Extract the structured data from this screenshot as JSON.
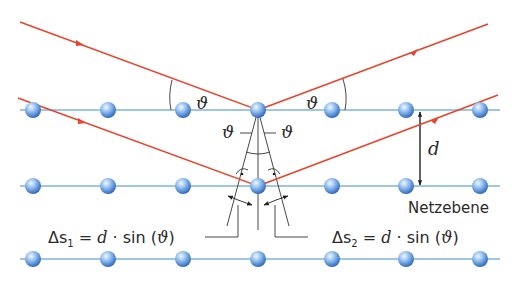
{
  "colors": {
    "ray": "#e8432b",
    "plane": "#7fb2e0",
    "atom_light": "#e6f1fc",
    "atom_mid": "#6aa6e4",
    "atom_dark": "#2a64b8",
    "construction": "#333333"
  },
  "labels": {
    "theta_symbol": "ϑ",
    "spacing_symbol": "d",
    "plane_label": "Netzebene",
    "delta_s1": "Δs₁ = d · sin (ϑ)",
    "delta_s2": "Δs₂ = d · sin (ϑ)",
    "delta_s1_parts": {
      "lhs": "Δs",
      "sub": "1",
      "eq": " = ",
      "d": "d",
      "dot": " · ",
      "sin": "sin (",
      "theta": "ϑ",
      "close": ")"
    },
    "delta_s2_parts": {
      "lhs": "Δs",
      "sub": "2",
      "eq": " = ",
      "d": "d",
      "dot": " · ",
      "sin": "sin (",
      "theta": "ϑ",
      "close": ")"
    }
  },
  "lattice": {
    "planes": 3,
    "atoms_per_plane": 7
  }
}
